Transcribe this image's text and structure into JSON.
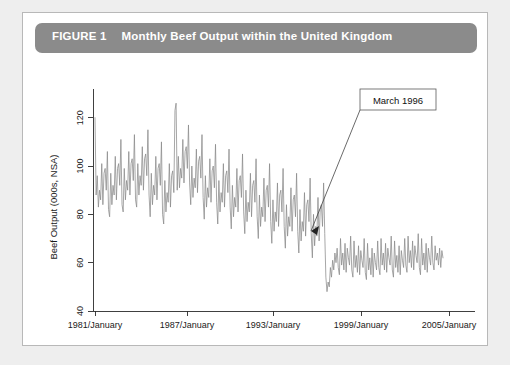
{
  "figure": {
    "label": "FIGURE 1",
    "title": "Monthly Beef Output within the United Kingdom",
    "title_full": "FIGURE 1  Monthly Beef Output within the United Kingdom",
    "header_bg": "#8b8b8b",
    "header_text_color": "#ffffff",
    "card_bg": "#ffffff",
    "page_bg": "#eeeeee"
  },
  "annotation": {
    "label": "March 1996",
    "target_value": 72,
    "target_x_label": "1996/March"
  },
  "chart_data": {
    "type": "line",
    "title": "Monthly Beef Output within the United Kingdom",
    "xlabel": "",
    "ylabel": "Beef Output (000s, NSA)",
    "series_color": "#8a8a8a",
    "grid": false,
    "legend": "none",
    "ylim": [
      40,
      130
    ],
    "yticks": [
      40,
      60,
      80,
      100,
      120
    ],
    "ytick_labels": [
      "40",
      "60",
      "80",
      "100",
      "120"
    ],
    "xlim": [
      "1981/January",
      "2006/July"
    ],
    "xticks": [
      "1981/January",
      "1987/January",
      "1993/January",
      "1999/January",
      "2005/January"
    ],
    "xtick_labels": [
      "1981/January",
      "1987/January",
      "1993/January",
      "1999/January",
      "2005/January"
    ],
    "x_start_year": 1981,
    "x_start_month": 1,
    "x_frequency": "monthly",
    "n_points": 306,
    "values": [
      120,
      88,
      96,
      83,
      90,
      86,
      101,
      84,
      97,
      99,
      90,
      106,
      82,
      79,
      97,
      84,
      92,
      88,
      104,
      86,
      99,
      101,
      92,
      111,
      84,
      81,
      99,
      86,
      94,
      90,
      106,
      88,
      101,
      103,
      94,
      113,
      86,
      83,
      101,
      88,
      96,
      92,
      108,
      90,
      103,
      105,
      96,
      115,
      88,
      79,
      97,
      84,
      92,
      88,
      104,
      86,
      99,
      101,
      92,
      110,
      80,
      76,
      94,
      81,
      89,
      85,
      101,
      83,
      96,
      98,
      89,
      123,
      126,
      90,
      104,
      91,
      99,
      95,
      111,
      93,
      106,
      108,
      99,
      117,
      93,
      84,
      100,
      87,
      95,
      91,
      107,
      89,
      102,
      104,
      95,
      113,
      87,
      78,
      96,
      83,
      91,
      87,
      103,
      85,
      98,
      100,
      91,
      109,
      85,
      76,
      94,
      81,
      89,
      85,
      101,
      83,
      96,
      98,
      89,
      107,
      83,
      74,
      92,
      79,
      87,
      83,
      99,
      81,
      94,
      96,
      87,
      105,
      81,
      72,
      90,
      77,
      85,
      81,
      97,
      79,
      92,
      94,
      85,
      103,
      79,
      70,
      88,
      75,
      83,
      79,
      95,
      77,
      90,
      92,
      83,
      101,
      77,
      68,
      86,
      73,
      81,
      77,
      93,
      75,
      88,
      90,
      81,
      99,
      75,
      66,
      84,
      71,
      79,
      75,
      91,
      73,
      86,
      88,
      79,
      97,
      73,
      64,
      82,
      69,
      77,
      73,
      89,
      71,
      84,
      86,
      77,
      95,
      72,
      62,
      80,
      67,
      75,
      71,
      87,
      69,
      82,
      84,
      75,
      93,
      72,
      54,
      48,
      52,
      50,
      58,
      54,
      61,
      57,
      64,
      60,
      66,
      58,
      55,
      70,
      59,
      64,
      57,
      68,
      56,
      66,
      62,
      59,
      71,
      57,
      54,
      69,
      58,
      63,
      56,
      67,
      55,
      65,
      61,
      58,
      70,
      56,
      53,
      68,
      57,
      62,
      55,
      66,
      54,
      64,
      60,
      57,
      69,
      58,
      55,
      70,
      59,
      64,
      57,
      68,
      56,
      66,
      62,
      59,
      71,
      57,
      54,
      69,
      58,
      63,
      56,
      67,
      55,
      65,
      61,
      58,
      70,
      59,
      56,
      71,
      60,
      65,
      58,
      69,
      57,
      67,
      63,
      60,
      72,
      58,
      55,
      70,
      59,
      64,
      57,
      68,
      56,
      66,
      62,
      59,
      71,
      60,
      57,
      67,
      61,
      64,
      59,
      66,
      58,
      65,
      62
    ]
  }
}
